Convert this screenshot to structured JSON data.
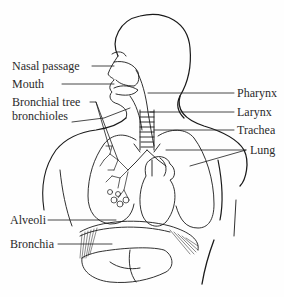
{
  "diagram": {
    "labels": {
      "left": [
        {
          "id": "nasal_passage",
          "text": "Nasal passage"
        },
        {
          "id": "mouth",
          "text": "Mouth"
        },
        {
          "id": "bronchial_tree_line1",
          "text": "Bronchial tree"
        },
        {
          "id": "bronchial_tree_line2",
          "text": "bronchioles"
        },
        {
          "id": "alveoli",
          "text": "Alveoli"
        },
        {
          "id": "bronchia",
          "text": "Bronchia"
        }
      ],
      "right": [
        {
          "id": "pharynx",
          "text": "Pharynx"
        },
        {
          "id": "larynx",
          "text": "Larynx"
        },
        {
          "id": "trachea",
          "text": "Trachea"
        },
        {
          "id": "lung",
          "text": "Lung"
        }
      ]
    },
    "colors": {
      "line": "#1a1a1a",
      "text": "#2a2a2a",
      "background": "#fefefe"
    }
  }
}
